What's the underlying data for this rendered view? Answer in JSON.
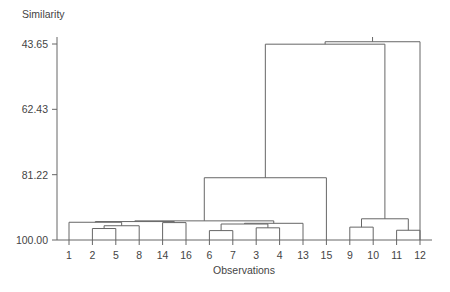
{
  "chart_data": {
    "type": "line",
    "title": "",
    "ylabel": "Similarity",
    "xlabel": "Observations",
    "ylim": [
      43.65,
      100.0
    ],
    "y_axis_inverted": true,
    "grid": false,
    "legend": "none",
    "y_ticks": [
      {
        "value": 43.65,
        "label": "43.65"
      },
      {
        "value": 62.43,
        "label": "62.43"
      },
      {
        "value": 81.22,
        "label": "81.22"
      },
      {
        "value": 100.0,
        "label": "100.00"
      }
    ],
    "leaf_order": [
      1,
      2,
      5,
      8,
      14,
      16,
      6,
      7,
      3,
      4,
      13,
      15,
      9,
      10,
      11,
      12
    ],
    "leaf_labels": [
      "1",
      "2",
      "5",
      "8",
      "14",
      "16",
      "6",
      "7",
      "3",
      "4",
      "13",
      "15",
      "9",
      "10",
      "11",
      "12"
    ],
    "merges": [
      {
        "id": "m1",
        "left": "2",
        "right": "5",
        "similarity": 96.7
      },
      {
        "id": "m2",
        "left": "m1",
        "right": "8",
        "similarity": 95.9
      },
      {
        "id": "m3",
        "left": "1",
        "right": "m2",
        "similarity": 94.9
      },
      {
        "id": "m4",
        "left": "14",
        "right": "16",
        "similarity": 95.0
      },
      {
        "id": "m5",
        "left": "3",
        "right": "4",
        "similarity": 96.5
      },
      {
        "id": "m6",
        "left": "6",
        "right": "7",
        "similarity": 97.3
      },
      {
        "id": "m7",
        "left": "m6",
        "right": "m5",
        "similarity": 95.4
      },
      {
        "id": "m8",
        "left": "m7",
        "right": "13",
        "similarity": 95.2
      },
      {
        "id": "m9",
        "left": "m3",
        "right": "m4",
        "similarity": 94.7
      },
      {
        "id": "m10",
        "left": "m9",
        "right": "m8",
        "similarity": 94.5
      },
      {
        "id": "m11",
        "left": "m10",
        "right": "15",
        "similarity": 82.1
      },
      {
        "id": "m12",
        "left": "9",
        "right": "10",
        "similarity": 96.3
      },
      {
        "id": "m13",
        "left": "11",
        "right": "12",
        "similarity": 97.2
      },
      {
        "id": "m14",
        "left": "m12",
        "right": "m13",
        "similarity": 93.9
      },
      {
        "id": "m15",
        "left": "m11",
        "right": "m14",
        "similarity": 43.7
      },
      {
        "id": "m16",
        "left": "m15",
        "right": "12",
        "similarity": 43.0
      }
    ],
    "colors": {
      "line": "#666666",
      "text": "#444444",
      "background": "#ffffff"
    }
  },
  "axes": {
    "y_title": "Similarity",
    "x_title": "Observations"
  }
}
